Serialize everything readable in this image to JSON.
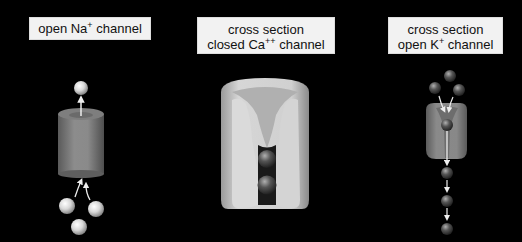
{
  "figure": {
    "panels": [
      {
        "id": "na",
        "label_base": "open Na",
        "label_sup": "+",
        "label_suffix": " channel",
        "state": "open",
        "ion": "Na+",
        "view": "external",
        "ions_shown": 4
      },
      {
        "id": "ca",
        "label_line1": "cross section",
        "label_base": "closed Ca",
        "label_sup": "++",
        "label_suffix": " channel",
        "state": "closed",
        "ion": "Ca++",
        "view": "cross section",
        "ions_shown": 2
      },
      {
        "id": "k",
        "label_line1": "cross section",
        "label_base": "open K",
        "label_sup": "+",
        "label_suffix": " channel",
        "state": "open",
        "ion": "K+",
        "view": "cross section",
        "ions_shown": 7
      }
    ],
    "colors": {
      "background": "#000000",
      "label_bg": "#f2f2f2",
      "channel_gray": "#8a8a8a",
      "ion_light": "#e8e8e8",
      "ion_dark": "#555555"
    }
  }
}
